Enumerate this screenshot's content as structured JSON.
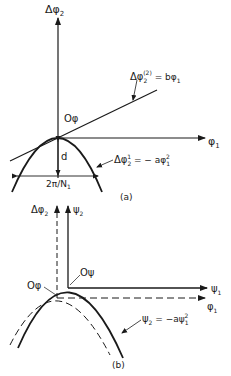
{
  "panel_a": {
    "caption": "(a)",
    "y_axis_label": "Δφ",
    "y_axis_sub": "2",
    "x_axis_label": "φ",
    "x_axis_sub": "1",
    "origin_label": "Oφ",
    "line_eq": {
      "lhs": "Δφ",
      "sub": "2",
      "sup": "(2)",
      "rhs": " = bφ",
      "rhs_sub": "1"
    },
    "parabola_eq": {
      "lhs": "Δφ",
      "sub": "2",
      "sup": "1",
      "rhs": " = − aφ",
      "rhs_sub": "1",
      "rhs_sup": "2"
    },
    "depth_label": "d",
    "width_label": "2π/N",
    "width_sub": "1"
  },
  "panel_b": {
    "caption": "(b)",
    "dashed_y_label": "Δφ",
    "dashed_y_sub": "2",
    "solid_y_label": "ψ",
    "solid_y_sub": "2",
    "solid_x_label": "ψ",
    "solid_x_sub": "1",
    "dashed_x_label": "φ",
    "dashed_x_sub": "1",
    "origin_psi": "Oψ",
    "origin_phi": "Oφ",
    "parabola_eq": {
      "lhs": "ψ",
      "sub": "2",
      "rhs": " = −aψ",
      "rhs_sub": "1",
      "rhs_sup": "2"
    }
  },
  "colors": {
    "ink": "#1a1a1a",
    "background": "#ffffff"
  }
}
